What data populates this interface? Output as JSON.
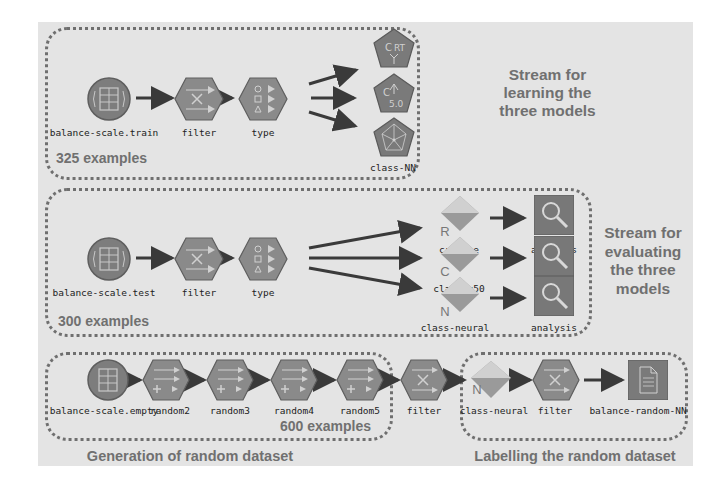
{
  "colors": {
    "panel_bg": "#e4e4e4",
    "node_fill": "#8a8a8a",
    "node_dark": "#5e5e5e",
    "diamond_light": "#cfcfcf",
    "diamond_dark": "#8e8e8e",
    "border": "#6f6f6f",
    "caption": "#707070"
  },
  "sections": {
    "learning": {
      "caption": "Stream for learning the three models",
      "caption_lines": [
        "Stream for",
        "learning the",
        "three models"
      ],
      "count": "325 examples",
      "nodes": [
        {
          "id": "train-source",
          "label": "balance-scale.train",
          "shape": "circle",
          "icon": "database-icon"
        },
        {
          "id": "train-filter",
          "label": "filter",
          "shape": "hexagon",
          "icon": "filter-icon"
        },
        {
          "id": "train-type",
          "label": "type",
          "shape": "hexagon",
          "icon": "type-icon"
        },
        {
          "id": "model-crt",
          "label": "",
          "shape": "pentagon",
          "icon": "c-rt-model-icon",
          "glyph": "C RT"
        },
        {
          "id": "model-c50",
          "label": "",
          "shape": "pentagon",
          "icon": "c50-model-icon",
          "glyph": "C 5.0"
        },
        {
          "id": "model-nn",
          "label": "class-NN",
          "shape": "pentagon",
          "icon": "neural-net-model-icon"
        }
      ]
    },
    "evaluating": {
      "caption": "Stream for evaluating the three models",
      "caption_lines": [
        "Stream for",
        "evaluating",
        "the three",
        "models"
      ],
      "count": "300 examples",
      "nodes": [
        {
          "id": "test-source",
          "label": "balance-scale.test",
          "shape": "circle",
          "icon": "database-icon"
        },
        {
          "id": "test-filter",
          "label": "filter",
          "shape": "hexagon",
          "icon": "filter-icon"
        },
        {
          "id": "test-type",
          "label": "type",
          "shape": "hexagon",
          "icon": "type-icon"
        },
        {
          "id": "nugget-crtree",
          "label": "cr-tree",
          "shape": "diamond",
          "letter": "R",
          "icon": "model-nugget-icon"
        },
        {
          "id": "nugget-c50",
          "label": "class-c50",
          "shape": "diamond",
          "letter": "C",
          "icon": "model-nugget-icon"
        },
        {
          "id": "nugget-neural",
          "label": "class-neural",
          "shape": "diamond",
          "letter": "N",
          "icon": "model-nugget-icon"
        },
        {
          "id": "analysis-1",
          "label": "analysis",
          "shape": "square",
          "icon": "magnifier-icon"
        },
        {
          "id": "analysis-2",
          "label": "analysis",
          "shape": "square",
          "icon": "magnifier-icon"
        },
        {
          "id": "analysis-3",
          "label": "analysis",
          "shape": "square",
          "icon": "magnifier-icon"
        }
      ]
    },
    "generation": {
      "caption": "Generation of random dataset",
      "count": "600 examples",
      "nodes": [
        {
          "id": "empty-source",
          "label": "balance-scale.empty",
          "shape": "circle",
          "icon": "database-icon"
        },
        {
          "id": "random2",
          "label": "random2",
          "shape": "hexagon",
          "icon": "derive-icon"
        },
        {
          "id": "random3",
          "label": "random3",
          "shape": "hexagon",
          "icon": "derive-icon"
        },
        {
          "id": "random4",
          "label": "random4",
          "shape": "hexagon",
          "icon": "derive-icon"
        },
        {
          "id": "random5",
          "label": "random5",
          "shape": "hexagon",
          "icon": "derive-icon"
        }
      ]
    },
    "bridge": {
      "nodes": [
        {
          "id": "bridge-filter",
          "label": "filter",
          "shape": "hexagon",
          "icon": "filter-icon"
        }
      ]
    },
    "labelling": {
      "caption": "Labelling the random dataset",
      "nodes": [
        {
          "id": "label-neural",
          "label": "class-neural",
          "shape": "diamond",
          "letter": "N",
          "icon": "model-nugget-icon"
        },
        {
          "id": "label-filter",
          "label": "filter",
          "shape": "hexagon",
          "icon": "filter-icon"
        },
        {
          "id": "output-file",
          "label": "balance-random-NN",
          "shape": "square",
          "icon": "document-icon"
        }
      ]
    }
  }
}
